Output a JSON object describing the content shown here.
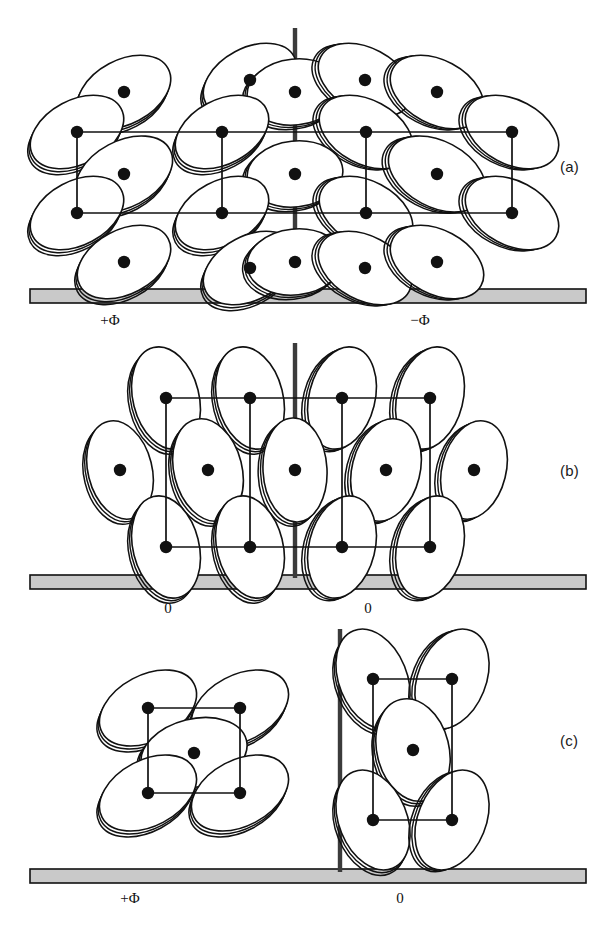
{
  "figure": {
    "panels": [
      {
        "id": "a",
        "letter": "(a)",
        "domain_labels": [
          {
            "text": "+Φ",
            "x": 110,
            "y": 312
          },
          {
            "text": "−Φ",
            "x": 420,
            "y": 312
          }
        ],
        "wall_x": 295,
        "wall_top": 28,
        "wall_bottom": 292,
        "substrate": {
          "x": 30,
          "y": 289,
          "width": 556,
          "height": 14
        },
        "lattice_rows_y": [
          132,
          213
        ],
        "lattice_cols_x": [
          77,
          222,
          366,
          512
        ],
        "discs": [
          {
            "cx": 124,
            "cy": 92,
            "rx": 50,
            "ry": 32,
            "rot": -28
          },
          {
            "cx": 250,
            "cy": 80,
            "rx": 50,
            "ry": 32,
            "rot": -28
          },
          {
            "cx": 295,
            "cy": 92,
            "rx": 48,
            "ry": 33,
            "rot": -6
          },
          {
            "cx": 365,
            "cy": 80,
            "rx": 50,
            "ry": 32,
            "rot": 28
          },
          {
            "cx": 437,
            "cy": 92,
            "rx": 50,
            "ry": 32,
            "rot": 28
          },
          {
            "cx": 77,
            "cy": 132,
            "rx": 50,
            "ry": 32,
            "rot": -28
          },
          {
            "cx": 222,
            "cy": 132,
            "rx": 50,
            "ry": 32,
            "rot": -28
          },
          {
            "cx": 366,
            "cy": 132,
            "rx": 50,
            "ry": 32,
            "rot": 28
          },
          {
            "cx": 512,
            "cy": 132,
            "rx": 50,
            "ry": 32,
            "rot": 28
          },
          {
            "cx": 124,
            "cy": 174,
            "rx": 52,
            "ry": 33,
            "rot": -28
          },
          {
            "cx": 295,
            "cy": 174,
            "rx": 48,
            "ry": 33,
            "rot": -6
          },
          {
            "cx": 437,
            "cy": 174,
            "rx": 52,
            "ry": 33,
            "rot": 28
          },
          {
            "cx": 77,
            "cy": 213,
            "rx": 50,
            "ry": 32,
            "rot": -28
          },
          {
            "cx": 222,
            "cy": 213,
            "rx": 50,
            "ry": 32,
            "rot": -28
          },
          {
            "cx": 366,
            "cy": 213,
            "rx": 50,
            "ry": 32,
            "rot": 28
          },
          {
            "cx": 512,
            "cy": 213,
            "rx": 50,
            "ry": 32,
            "rot": 28
          },
          {
            "cx": 124,
            "cy": 262,
            "rx": 50,
            "ry": 32,
            "rot": -28
          },
          {
            "cx": 250,
            "cy": 268,
            "rx": 50,
            "ry": 32,
            "rot": -28
          },
          {
            "cx": 295,
            "cy": 262,
            "rx": 48,
            "ry": 33,
            "rot": -6
          },
          {
            "cx": 365,
            "cy": 268,
            "rx": 50,
            "ry": 32,
            "rot": 28
          },
          {
            "cx": 437,
            "cy": 262,
            "rx": 50,
            "ry": 32,
            "rot": 28
          }
        ]
      },
      {
        "id": "b",
        "letter": "(b)",
        "domain_labels": [
          {
            "text": "0",
            "x": 168,
            "y": 600
          },
          {
            "text": "0",
            "x": 368,
            "y": 600
          }
        ],
        "wall_x": 295,
        "wall_top": 343,
        "wall_bottom": 578,
        "substrate": {
          "x": 30,
          "y": 575,
          "width": 556,
          "height": 14
        },
        "lattice_rows_y": [
          398,
          547
        ],
        "lattice_cols_x": [
          166,
          250,
          342,
          430
        ],
        "discs": [
          {
            "cx": 166,
            "cy": 398,
            "rx": 33,
            "ry": 52,
            "rot": -14
          },
          {
            "cx": 250,
            "cy": 398,
            "rx": 33,
            "ry": 52,
            "rot": -14
          },
          {
            "cx": 342,
            "cy": 398,
            "rx": 33,
            "ry": 52,
            "rot": 14
          },
          {
            "cx": 430,
            "cy": 398,
            "rx": 33,
            "ry": 52,
            "rot": 14
          },
          {
            "cx": 120,
            "cy": 470,
            "rx": 32,
            "ry": 50,
            "rot": -14
          },
          {
            "cx": 208,
            "cy": 470,
            "rx": 34,
            "ry": 52,
            "rot": -14
          },
          {
            "cx": 295,
            "cy": 470,
            "rx": 32,
            "ry": 52,
            "rot": -3
          },
          {
            "cx": 386,
            "cy": 470,
            "rx": 34,
            "ry": 52,
            "rot": 14
          },
          {
            "cx": 474,
            "cy": 470,
            "rx": 32,
            "ry": 50,
            "rot": 14
          },
          {
            "cx": 166,
            "cy": 547,
            "rx": 33,
            "ry": 52,
            "rot": -14
          },
          {
            "cx": 250,
            "cy": 547,
            "rx": 33,
            "ry": 52,
            "rot": -14
          },
          {
            "cx": 342,
            "cy": 547,
            "rx": 33,
            "ry": 52,
            "rot": 14
          },
          {
            "cx": 430,
            "cy": 547,
            "rx": 33,
            "ry": 52,
            "rot": 14
          }
        ]
      },
      {
        "id": "c",
        "letter": "(c)",
        "domain_labels": [
          {
            "text": "+Φ",
            "x": 130,
            "y": 890
          },
          {
            "text": "0",
            "x": 400,
            "y": 890
          }
        ],
        "wall_x": 340,
        "wall_top": 629,
        "wall_bottom": 872,
        "substrate": {
          "x": 30,
          "y": 869,
          "width": 556,
          "height": 14
        },
        "cells": [
          {
            "name": "left-cell",
            "rows_y": [
              708,
              793
            ],
            "cols_x": [
              148,
              240
            ]
          },
          {
            "name": "right-cell",
            "rows_y": [
              679,
              820
            ],
            "cols_x": [
              373,
              452
            ]
          }
        ],
        "discs": [
          {
            "cx": 148,
            "cy": 708,
            "rx": 52,
            "ry": 33,
            "rot": -28
          },
          {
            "cx": 240,
            "cy": 708,
            "rx": 52,
            "ry": 33,
            "rot": -28
          },
          {
            "cx": 194,
            "cy": 753,
            "rx": 54,
            "ry": 34,
            "rot": -14
          },
          {
            "cx": 148,
            "cy": 793,
            "rx": 52,
            "ry": 33,
            "rot": -28
          },
          {
            "cx": 240,
            "cy": 793,
            "rx": 52,
            "ry": 33,
            "rot": -28
          },
          {
            "cx": 373,
            "cy": 679,
            "rx": 34,
            "ry": 52,
            "rot": -22
          },
          {
            "cx": 452,
            "cy": 679,
            "rx": 34,
            "ry": 52,
            "rot": 22
          },
          {
            "cx": 413,
            "cy": 750,
            "rx": 36,
            "ry": 52,
            "rot": -14
          },
          {
            "cx": 373,
            "cy": 820,
            "rx": 34,
            "ry": 52,
            "rot": -22
          },
          {
            "cx": 452,
            "cy": 820,
            "rx": 34,
            "ry": 52,
            "rot": 22
          }
        ]
      }
    ],
    "colors": {
      "stroke": "#111111",
      "substrate_fill": "#c9c9c9",
      "wall": "#3b3b3b",
      "disc_fill": "#ffffff",
      "background": "#ffffff"
    },
    "geometry": {
      "disc_depth_dx": -5,
      "disc_depth_dy": 4,
      "dot_radius": 6.2,
      "width": 614,
      "height": 937
    }
  }
}
